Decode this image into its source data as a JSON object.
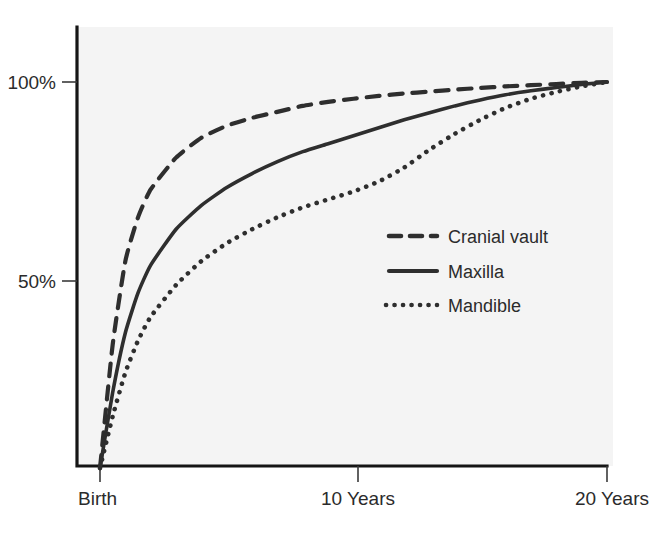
{
  "chart_data": {
    "type": "line",
    "title": "",
    "subtitle": "",
    "xlabel": "",
    "ylabel": "",
    "xlim": [
      0,
      20
    ],
    "ylim": [
      0,
      105
    ],
    "grid": false,
    "legend_position": "inside-right",
    "x_tick_labels": [
      "Birth",
      "10 Years",
      "20 Years"
    ],
    "x_tick_values": [
      0,
      10,
      20
    ],
    "y_tick_labels": [
      "100%",
      "50%"
    ],
    "y_tick_values": [
      100,
      50
    ],
    "x": [
      0,
      0.5,
      1,
      1.5,
      2,
      3,
      4,
      5,
      6,
      7,
      8,
      9,
      10,
      11,
      12,
      13,
      14,
      15,
      16,
      17,
      18,
      19,
      20
    ],
    "series": [
      {
        "name": "Cranial vault",
        "style": "dashed",
        "color": "#2e2e2e",
        "values": [
          3,
          34,
          55,
          66,
          73,
          81,
          86,
          89,
          91,
          92.5,
          94,
          95,
          95.8,
          96.5,
          97.1,
          97.6,
          98.1,
          98.5,
          98.9,
          99.2,
          99.5,
          99.8,
          100
        ]
      },
      {
        "name": "Maxilla",
        "style": "solid",
        "color": "#2e2e2e",
        "values": [
          3,
          22,
          37,
          47,
          54,
          63,
          69,
          73.5,
          77,
          80,
          82.5,
          84.5,
          86.5,
          88.5,
          90.5,
          92.3,
          94,
          95.5,
          96.8,
          97.8,
          98.6,
          99.4,
          100
        ]
      },
      {
        "name": "Mandible",
        "style": "dotted",
        "color": "#2e2e2e",
        "values": [
          3,
          16,
          27,
          35,
          41,
          49,
          55,
          59.5,
          63,
          66,
          68.5,
          70.5,
          72.5,
          75,
          78.5,
          83,
          87,
          90.5,
          93.5,
          95.8,
          97.5,
          98.9,
          100
        ]
      }
    ],
    "legend_entries": [
      {
        "label": "Cranial vault",
        "style": "dashed"
      },
      {
        "label": "Maxilla",
        "style": "solid"
      },
      {
        "label": "Mandible",
        "style": "dotted"
      }
    ],
    "colors": {
      "plot_background": "#f4f4f4",
      "page_background": "#ffffff",
      "axis": "#151515",
      "text": "#2b2b2b",
      "series": "#2e2e2e"
    }
  }
}
